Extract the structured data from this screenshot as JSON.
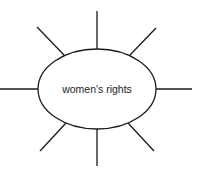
{
  "diagram": {
    "type": "concept-web",
    "center_label": "women's rights",
    "spoke_count": 8,
    "stroke_color": "#1a1a1a",
    "background": "#ffffff"
  }
}
